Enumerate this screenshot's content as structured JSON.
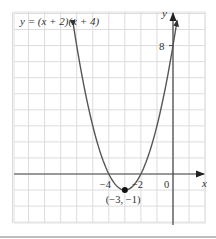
{
  "chart_data": {
    "type": "line",
    "title": "y = (x + 2)(x + 4)",
    "xlabel": "x",
    "ylabel": "y",
    "xlim": [
      -10,
      2
    ],
    "ylim": [
      -3,
      10
    ],
    "grid": true,
    "grid_step": 1,
    "function": "(x + 2)(x + 4)",
    "curve_domain": [
      -6.2,
      0.25
    ],
    "x_tick_labels": [
      {
        "value": -4,
        "label": "−4"
      },
      {
        "value": -2,
        "label": "−2"
      },
      {
        "value": 0,
        "label": "0"
      }
    ],
    "y_tick_labels": [
      {
        "value": 8,
        "label": "8"
      }
    ],
    "series": [
      {
        "name": "y = (x + 2)(x + 4)",
        "x": [
          -6.2,
          -6,
          -5.5,
          -5,
          -4.5,
          -4,
          -3.5,
          -3,
          -2.5,
          -2,
          -1.5,
          -1,
          -0.5,
          0,
          0.25
        ],
        "values": [
          9.24,
          8,
          5.25,
          3,
          1.25,
          0,
          -0.75,
          -1,
          -0.75,
          0,
          1.25,
          3,
          5.25,
          8,
          9.56
        ]
      }
    ],
    "annotations": [
      {
        "type": "point",
        "x": -3,
        "y": -1,
        "label": "(−3, −1)",
        "role": "vertex"
      }
    ],
    "colors": {
      "curve": "#555555",
      "axes": "#444444",
      "grid": "#dcdcdc",
      "point": "#111111",
      "text": "#333333"
    }
  }
}
